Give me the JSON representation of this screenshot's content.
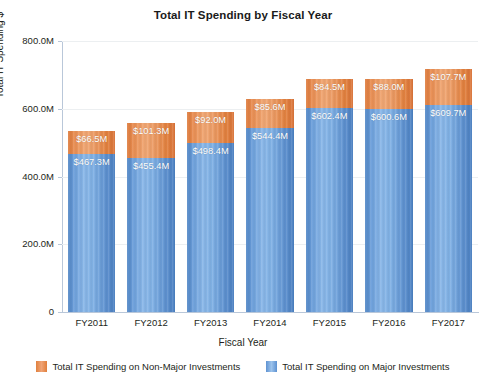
{
  "chart_data": {
    "type": "bar",
    "subtype": "stacked-column",
    "title": "Total IT Spending by Fiscal Year",
    "xlabel": "Fiscal Year",
    "ylabel": "Total IT Spending $",
    "categories": [
      "FY2011",
      "FY2012",
      "FY2013",
      "FY2014",
      "FY2015",
      "FY2016",
      "FY2017"
    ],
    "ylim": [
      0,
      800000000
    ],
    "ytick_labels": [
      "0",
      "200.0M",
      "400.0M",
      "600.0M",
      "800.0M"
    ],
    "ytick_values": [
      0,
      200000000,
      400000000,
      600000000,
      800000000
    ],
    "grid": true,
    "legend_position": "bottom",
    "series": [
      {
        "name": "Total IT Spending on Major Investments",
        "color": "#6ea1dc",
        "stack_order": 0,
        "values": [
          467300000,
          455400000,
          498400000,
          544400000,
          602400000,
          600600000,
          609700000
        ],
        "labels": [
          "$467.3M",
          "$455.4M",
          "$498.4M",
          "$544.4M",
          "$602.4M",
          "$600.6M",
          "$609.7M"
        ]
      },
      {
        "name": "Total IT Spending on Non-Major Investments",
        "color": "#ea9156",
        "stack_order": 1,
        "values": [
          66500000,
          101300000,
          92000000,
          85600000,
          84500000,
          88000000,
          107700000
        ],
        "labels": [
          "$66.5M",
          "$101.3M",
          "$92.0M",
          "$85.6M",
          "$84.5M",
          "$88.0M",
          "$107.7M"
        ]
      }
    ],
    "totals": [
      533800000,
      556700000,
      590400000,
      630000000,
      686900000,
      688600000,
      717400000
    ]
  },
  "legend": {
    "items": [
      {
        "label": "Total IT Spending on Non-Major Investments",
        "swatch": "nonmajor"
      },
      {
        "label": "Total IT Spending on Major Investments",
        "swatch": "major"
      }
    ]
  }
}
